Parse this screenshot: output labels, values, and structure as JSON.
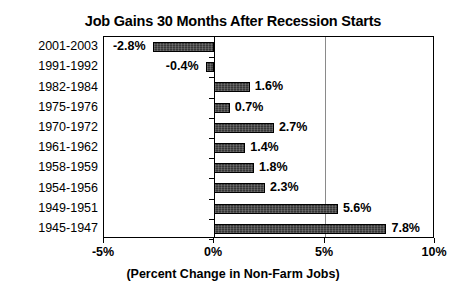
{
  "chart_data": {
    "type": "bar",
    "orientation": "horizontal",
    "title": "Job Gains 30 Months After Recession Starts",
    "xlabel": "(Percent Change in Non-Farm Jobs)",
    "ylabel": "",
    "xlim": [
      -5,
      10
    ],
    "ylim": null,
    "grid": true,
    "gridlines_x": [
      5
    ],
    "legend": null,
    "xticks": [
      -5,
      0,
      5,
      10
    ],
    "xtick_labels": [
      "-5%",
      "0%",
      "5%",
      "10%"
    ],
    "categories": [
      "2001-2003",
      "1991-1992",
      "1982-1984",
      "1975-1976",
      "1970-1972",
      "1961-1962",
      "1958-1959",
      "1954-1956",
      "1949-1951",
      "1945-1947"
    ],
    "values": [
      -2.8,
      -0.4,
      1.6,
      0.7,
      2.7,
      1.4,
      1.8,
      2.3,
      5.6,
      7.8
    ],
    "data_labels": [
      "-2.8%",
      "-0.4%",
      "1.6%",
      "0.7%",
      "2.7%",
      "1.4%",
      "1.8%",
      "2.3%",
      "5.6%",
      "7.8%"
    ],
    "bar_color": "#3d3d3d",
    "bar_border_color": "#000000",
    "gridline_color": "#8a8a8a",
    "axis_color": "#000000",
    "background_color": "#ffffff"
  }
}
